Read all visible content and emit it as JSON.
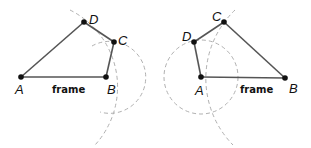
{
  "figure": {
    "left": {
      "points": {
        "A": "A",
        "B": "B",
        "C": "C",
        "D": "D"
      },
      "frame_label": "frame"
    },
    "right": {
      "points": {
        "A": "A",
        "B": "B",
        "C": "C",
        "D": "D"
      },
      "frame_label": "frame"
    }
  },
  "colors": {
    "edge": "#555555",
    "construction": "#b0b0b0",
    "point": "#111111"
  }
}
